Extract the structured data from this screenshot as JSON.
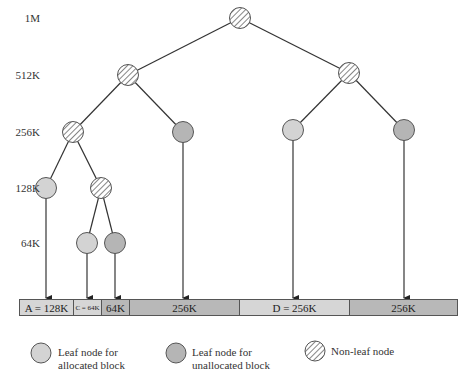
{
  "levels": [
    {
      "label": "1M",
      "y": 18
    },
    {
      "label": "512K",
      "y": 75
    },
    {
      "label": "256K",
      "y": 132
    },
    {
      "label": "128K",
      "y": 188
    },
    {
      "label": "64K",
      "y": 243
    }
  ],
  "colors": {
    "allocated": "#d3d3d3",
    "unallocated": "#b5b5b5",
    "edge": "#333333",
    "bar_allocated": "#d6d6d6",
    "bar_unallocated": "#b8b8b8"
  },
  "tree": {
    "nodes": [
      {
        "id": "root",
        "type": "non-leaf",
        "x": 240,
        "y": 18
      },
      {
        "id": "512a",
        "type": "non-leaf",
        "x": 128,
        "y": 75
      },
      {
        "id": "512b",
        "type": "non-leaf",
        "x": 349,
        "y": 73
      },
      {
        "id": "256a",
        "type": "non-leaf",
        "x": 73,
        "y": 132
      },
      {
        "id": "256b",
        "type": "unallocated",
        "x": 183,
        "y": 132
      },
      {
        "id": "256c",
        "type": "allocated",
        "x": 293,
        "y": 130
      },
      {
        "id": "256d",
        "type": "unallocated",
        "x": 404,
        "y": 130
      },
      {
        "id": "128a",
        "type": "allocated",
        "x": 46,
        "y": 188
      },
      {
        "id": "128b",
        "type": "non-leaf",
        "x": 101,
        "y": 188
      },
      {
        "id": "64a",
        "type": "allocated",
        "x": 87,
        "y": 243
      },
      {
        "id": "64b",
        "type": "unallocated",
        "x": 115,
        "y": 243
      }
    ],
    "edges": [
      [
        "root",
        "512a"
      ],
      [
        "root",
        "512b"
      ],
      [
        "512a",
        "256a"
      ],
      [
        "512a",
        "256b"
      ],
      [
        "512b",
        "256c"
      ],
      [
        "512b",
        "256d"
      ],
      [
        "256a",
        "128a"
      ],
      [
        "256a",
        "128b"
      ],
      [
        "128b",
        "64a"
      ],
      [
        "128b",
        "64b"
      ]
    ],
    "arrows": [
      {
        "from": "128a",
        "x": 46
      },
      {
        "from": "64a",
        "x": 87
      },
      {
        "from": "64b",
        "x": 115
      },
      {
        "from": "256b",
        "x": 183
      },
      {
        "from": "256c",
        "x": 293
      },
      {
        "from": "256d",
        "x": 404
      }
    ]
  },
  "memory_bar": {
    "segments": [
      {
        "label": "A = 128K",
        "state": "allocated",
        "x": 19,
        "w": 54
      },
      {
        "label": "C = 64K",
        "state": "allocated",
        "x": 73,
        "w": 28,
        "small": true
      },
      {
        "label": "64K",
        "state": "unallocated",
        "x": 101,
        "w": 28
      },
      {
        "label": "256K",
        "state": "unallocated",
        "x": 129,
        "w": 110
      },
      {
        "label": "D = 256K",
        "state": "allocated",
        "x": 239,
        "w": 110
      },
      {
        "label": "256K",
        "state": "unallocated",
        "x": 349,
        "w": 109
      }
    ]
  },
  "legend": {
    "allocated": {
      "line1": "Leaf node for",
      "line2": "allocated block"
    },
    "unallocated": {
      "line1": "Leaf node for",
      "line2": "unallocated block"
    },
    "nonleaf": {
      "line1": "Non-leaf node"
    }
  }
}
